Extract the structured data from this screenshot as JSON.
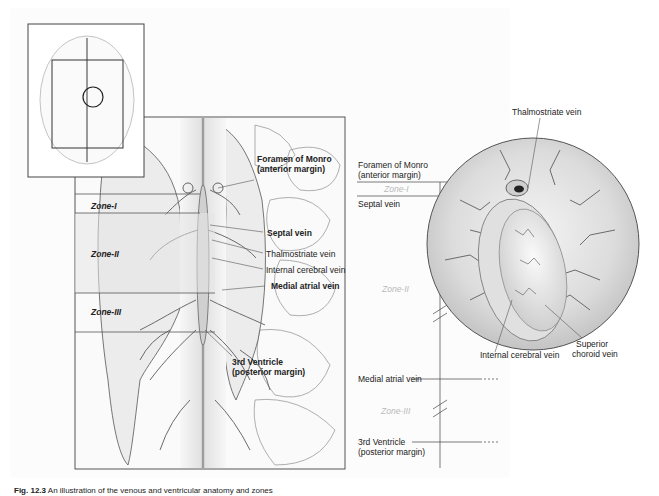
{
  "figure": {
    "inset": {
      "description": "Axial brain overview with zoom rectangle and circle"
    },
    "main_panel": {
      "zones": [
        {
          "label": "Zone-I"
        },
        {
          "label": "Zone-II"
        },
        {
          "label": "Zone-III"
        }
      ],
      "labels": {
        "foramen_line1": "Foramen of Monro",
        "foramen_line2": "(anterior margin)",
        "septal_vein": "Septal vein",
        "thalmostriate_vein": "Thalmostriate vein",
        "internal_cerebral_vein": "Internal cerebral vein",
        "medial_atrial_vein": "Medial atrial vein",
        "third_ventricle_line1": "3rd Ventricle",
        "third_ventricle_line2": "(posterior margin)"
      }
    },
    "scale": {
      "foramen_line1": "Foramen of Monro",
      "foramen_line2": "(anterior margin)",
      "zone_i": "Zone-I",
      "septal_vein": "Septal vein",
      "zone_ii": "Zone-II",
      "medial_atrial_vein": "Medial atrial vein",
      "zone_iii": "Zone-III",
      "third_ventricle_line1": "3rd Ventricle",
      "third_ventricle_line2": "(posterior margin)"
    },
    "circle_view": {
      "thalmostriate_vein": "Thalmostriate vein",
      "internal_cerebral_vein": "Internal cerebral vein",
      "superior_choroid_line1": "Superior",
      "superior_choroid_line2": "choroid vein"
    }
  },
  "caption": {
    "fig_number": "Fig. 12.3",
    "text": "An illustration of the venous and ventricular anatomy and zones"
  },
  "colors": {
    "line": "#444444",
    "zone_band": "#e6e6e6",
    "zone_right_text": "#b9b9b9",
    "vein": "#6a6a6a"
  }
}
